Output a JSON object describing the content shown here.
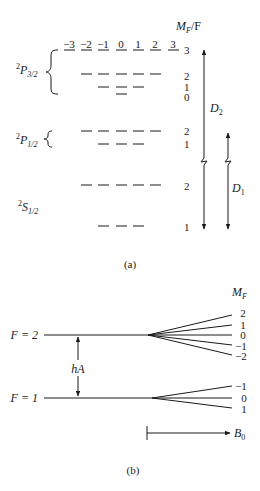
{
  "panel_a": {
    "caption": "(a)",
    "header": "M_F / F",
    "header_main": "M",
    "header_sub": "F",
    "header_tail": "/F",
    "mf_labels": [
      "−3",
      "−2",
      "−1",
      "0",
      "1",
      "2",
      "3"
    ],
    "levels": {
      "p32": {
        "term": "2",
        "letter": "P",
        "sub": "3/2",
        "F_values": [
          "3",
          "2",
          "1",
          "0"
        ]
      },
      "p12": {
        "term": "2",
        "letter": "P",
        "sub": "1/2",
        "F_values": [
          "2",
          "1"
        ]
      },
      "s12": {
        "term": "2",
        "letter": "S",
        "sub": "1/2",
        "F_values": [
          "2",
          "1"
        ]
      }
    },
    "transitions": {
      "d2": {
        "letter": "D",
        "sub": "2"
      },
      "d1": {
        "letter": "D",
        "sub": "1"
      }
    }
  },
  "panel_b": {
    "caption": "(b)",
    "header_main": "M",
    "header_sub": "F",
    "f2_label": "F = 2",
    "f1_label": "F = 1",
    "f2_mf": [
      "2",
      "1",
      "0",
      "−1",
      "−2"
    ],
    "f1_mf": [
      "−1",
      "0",
      "1"
    ],
    "splitting_label": "hA",
    "field_letter": "B",
    "field_sub": "0"
  }
}
